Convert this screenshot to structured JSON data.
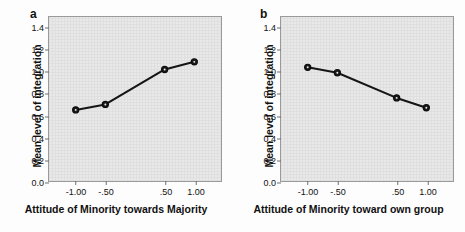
{
  "figure": {
    "background_color": "#fdfdfd",
    "plot_background_color": "#e9e9e9",
    "plot_border_color": "#9a9a9a",
    "line_color": "#151515"
  },
  "panels": [
    {
      "letter": "a",
      "ylabel": "Mean level of integration",
      "xlabel": "Attitude of Minority towards Majority",
      "xticks": [
        "-1.00",
        "-.50",
        ".50",
        "1.00"
      ],
      "yticks": [
        "1.4",
        "1.2",
        "1.0",
        "0.8",
        "0.6",
        "0.4",
        "0.2",
        "0.0"
      ]
    },
    {
      "letter": "b",
      "ylabel": "Mean level of integration",
      "xlabel": "Attitude of Minority toward own group",
      "xticks": [
        "-1.00",
        "-.50",
        ".50",
        "1.00"
      ],
      "yticks": [
        "1.4",
        "1.2",
        "1.0",
        "0.8",
        "0.6",
        "0.4",
        "0.2",
        "0.0"
      ]
    }
  ],
  "chart_data": [
    {
      "type": "line",
      "panel": "a",
      "title": "",
      "xlabel": "Attitude of Minority towards Majority",
      "ylabel": "Mean level of integration",
      "categories": [
        "-1.00",
        "-.50",
        ".50",
        "1.00"
      ],
      "x": [
        -1.0,
        -0.5,
        0.5,
        1.0
      ],
      "values": [
        0.65,
        0.7,
        1.02,
        1.09
      ],
      "ylim": [
        0.0,
        1.5
      ],
      "yticks": [
        0.0,
        0.2,
        0.4,
        0.6,
        0.8,
        1.0,
        1.2,
        1.4
      ],
      "grid": false,
      "legend": "none",
      "marker": "circle"
    },
    {
      "type": "line",
      "panel": "b",
      "title": "",
      "xlabel": "Attitude of Minority toward own group",
      "ylabel": "Mean level of integration",
      "categories": [
        "-1.00",
        "-.50",
        ".50",
        "1.00"
      ],
      "x": [
        -1.0,
        -0.5,
        0.5,
        1.0
      ],
      "values": [
        1.04,
        0.99,
        0.76,
        0.67
      ],
      "ylim": [
        0.0,
        1.5
      ],
      "yticks": [
        0.0,
        0.2,
        0.4,
        0.6,
        0.8,
        1.0,
        1.2,
        1.4
      ],
      "grid": false,
      "legend": "none",
      "marker": "circle"
    }
  ]
}
